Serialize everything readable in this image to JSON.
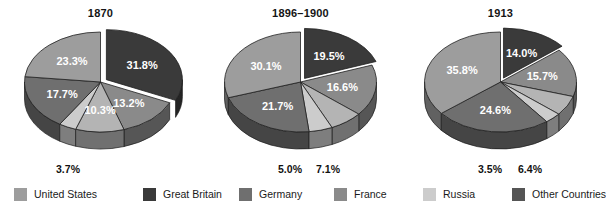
{
  "figure": {
    "background": "#ffffff"
  },
  "legend": {
    "position": "bottom",
    "items": [
      {
        "label": "United States",
        "color": "#9d9d9d",
        "x": 14
      },
      {
        "label": "Great Britain",
        "color": "#3a3a3a",
        "x": 143
      },
      {
        "label": "Germany",
        "color": "#6f6f6f",
        "x": 239
      },
      {
        "label": "France",
        "color": "#8a8a8a",
        "x": 334
      },
      {
        "label": "Russia",
        "color": "#cccccc",
        "x": 423
      },
      {
        "label": "Other Countries",
        "color": "#555555",
        "x": 512
      }
    ]
  },
  "chart_data": [
    {
      "type": "pie",
      "title": "1870",
      "xlabel": "",
      "ylabel": "",
      "unit": "percent",
      "exploded_slice": "Great Britain",
      "categories": [
        "Great Britain",
        "Germany",
        "France",
        "Russia",
        "Other Countries",
        "United States"
      ],
      "values": [
        31.8,
        13.2,
        10.3,
        3.7,
        17.7,
        23.3
      ],
      "labels": [
        "31.8%",
        "13.2%",
        "10.3%",
        "3.7%",
        "17.7%",
        "23.3%"
      ],
      "colors": [
        "#3a3a3a",
        "#8a8a8a",
        "#b4b4b4",
        "#cccccc",
        "#6f6f6f",
        "#9d9d9d"
      ],
      "label_placement": [
        "inside",
        "inside",
        "inside",
        "outside",
        "inside",
        "inside"
      ],
      "external_labels": [
        {
          "text": "3.7%",
          "x": 68,
          "y": 163
        }
      ]
    },
    {
      "type": "pie",
      "title": "1896–1900",
      "xlabel": "",
      "ylabel": "",
      "unit": "percent",
      "exploded_slice": "Great Britain",
      "categories": [
        "Great Britain",
        "Germany",
        "France",
        "Russia",
        "Other Countries",
        "United States"
      ],
      "values": [
        19.5,
        16.6,
        7.1,
        5.0,
        21.7,
        30.1
      ],
      "labels": [
        "19.5%",
        "16.6%",
        "7.1%",
        "5.0%",
        "21.7%",
        "30.1%"
      ],
      "colors": [
        "#3a3a3a",
        "#8a8a8a",
        "#b4b4b4",
        "#cccccc",
        "#6f6f6f",
        "#9d9d9d"
      ],
      "label_placement": [
        "inside",
        "inside",
        "outside",
        "outside",
        "inside",
        "inside"
      ],
      "external_labels": [
        {
          "text": "5.0%",
          "x": 90,
          "y": 163
        },
        {
          "text": "7.1%",
          "x": 128,
          "y": 163
        }
      ]
    },
    {
      "type": "pie",
      "title": "1913",
      "xlabel": "",
      "ylabel": "",
      "unit": "percent",
      "exploded_slice": "Great Britain",
      "categories": [
        "Great Britain",
        "Germany",
        "France",
        "Russia",
        "Other Countries",
        "United States"
      ],
      "values": [
        14.0,
        15.7,
        6.4,
        3.5,
        24.6,
        35.8
      ],
      "labels": [
        "14.0%",
        "15.7%",
        "6.4%",
        "3.5%",
        "24.6%",
        "35.8%"
      ],
      "colors": [
        "#3a3a3a",
        "#8a8a8a",
        "#b4b4b4",
        "#cccccc",
        "#6f6f6f",
        "#9d9d9d"
      ],
      "label_placement": [
        "inside",
        "inside",
        "outside",
        "outside",
        "inside",
        "inside"
      ],
      "external_labels": [
        {
          "text": "3.5%",
          "x": 90,
          "y": 163
        },
        {
          "text": "6.4%",
          "x": 130,
          "y": 163
        }
      ]
    }
  ]
}
